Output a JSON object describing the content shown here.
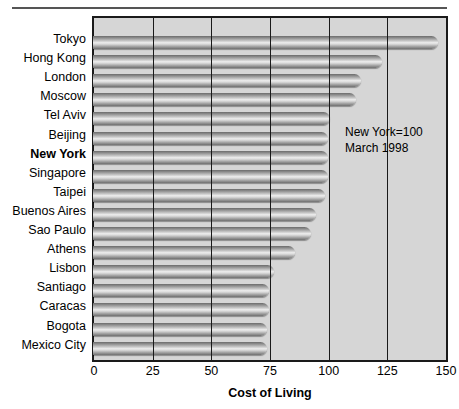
{
  "chart_data": {
    "type": "bar",
    "orientation": "horizontal",
    "title": "",
    "xlabel": "Cost of Living",
    "ylabel": "",
    "xlim": [
      0,
      150
    ],
    "xticks": [
      0,
      25,
      50,
      75,
      100,
      125,
      150
    ],
    "grid": true,
    "legend": null,
    "annotations": [
      "New York=100",
      "March 1998"
    ],
    "categories": [
      "Tokyo",
      "Hong Kong",
      "London",
      "Moscow",
      "Tel Aviv",
      "Beijing",
      "New York",
      "Singapore",
      "Taipei",
      "Buenos Aires",
      "Sao Paulo",
      "Athens",
      "Lisbon",
      "Santiago",
      "Caracas",
      "Bogota",
      "Mexico City"
    ],
    "values": [
      147,
      123,
      114,
      112,
      101,
      100,
      100,
      100,
      99,
      95,
      93,
      86,
      77,
      75,
      75,
      74,
      74
    ],
    "highlight_category": "New York"
  },
  "axis": {
    "tick_labels": [
      "0",
      "25",
      "50",
      "75",
      "100",
      "125",
      "150"
    ],
    "title": "Cost of Living"
  },
  "annotation": {
    "line1": "New York=100",
    "line2": "March 1998"
  },
  "colors": {
    "plot_background": "#d6d6d6",
    "frame": "#1a1a1a",
    "page_background": "#ffffff",
    "text": "#000000"
  }
}
